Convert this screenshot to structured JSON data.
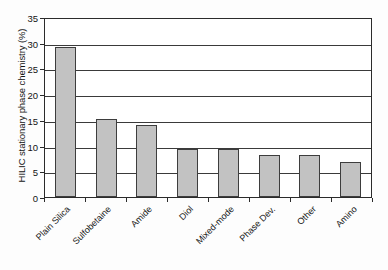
{
  "chart_data": {
    "type": "bar",
    "title": "",
    "xlabel": "",
    "ylabel": "HILIC stationary phase chemistry (%)",
    "categories": [
      "Plain Silica",
      "Sulfobetaine",
      "Amide",
      "Diol",
      "Mixed-mode",
      "Phase Dev.",
      "Other",
      "Amino"
    ],
    "values": [
      29.1,
      15.1,
      14.0,
      9.3,
      9.3,
      8.1,
      8.1,
      6.9
    ],
    "ylim": [
      0,
      35
    ],
    "yticks": [
      0,
      5,
      10,
      15,
      20,
      25,
      30,
      35
    ],
    "ytick_labels": [
      "0",
      "5",
      "10",
      "15",
      "20",
      "25",
      "30",
      "35"
    ],
    "grid": true,
    "grid_axis": "y",
    "legend": null,
    "bar_fill_color": "#c2c2c2",
    "bar_edge_color": "#3d3d3d",
    "axis_color": "#2b2b2b",
    "background_color": "#ffffff"
  }
}
